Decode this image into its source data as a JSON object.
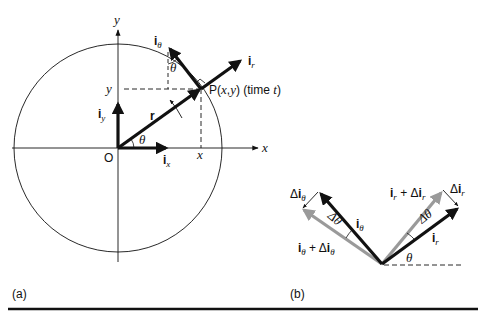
{
  "panel_a": {
    "label": "(a)",
    "axis_x_label": "x",
    "axis_y_label": "y",
    "origin_label": "O",
    "point_label": "P(x,y) (time t)",
    "point_label_parts": {
      "p": "P(",
      "x": "x",
      "comma": ",",
      "y": "y",
      "close": ")",
      "time": " (time ",
      "t": "t",
      "end": ")"
    },
    "x_tick_label": "x",
    "y_tick_label": "y",
    "radius_label": "r",
    "theta_label": "θ",
    "unit_vectors": {
      "i_r": {
        "base": "i",
        "sub": "r"
      },
      "i_theta": {
        "base": "i",
        "sub": "θ"
      },
      "i_x": {
        "base": "i",
        "sub": "x"
      },
      "i_y": {
        "base": "i",
        "sub": "y"
      }
    }
  },
  "panel_b": {
    "label": "(b)",
    "theta_label": "θ",
    "delta_theta_label": "Δθ",
    "vectors": {
      "i_r": {
        "base": "i",
        "sub": "r"
      },
      "i_r_plus": {
        "base": "i",
        "sub": "r",
        "mid": " + Δ",
        "base2": "i",
        "sub2": "r"
      },
      "delta_i_r": {
        "prefix": "Δ",
        "base": "i",
        "sub": "r"
      },
      "i_theta": {
        "base": "i",
        "sub": "θ"
      },
      "i_theta_plus": {
        "base": "i",
        "sub": "θ",
        "mid": " + Δ",
        "base2": "i",
        "sub2": "θ"
      },
      "delta_i_theta": {
        "prefix": "Δ",
        "base": "i",
        "sub": "θ"
      }
    }
  },
  "colors": {
    "ink": "#111111",
    "gray_vector": "#9a9a9a",
    "rule": "#111111"
  }
}
